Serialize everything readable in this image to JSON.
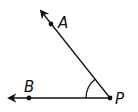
{
  "diagram": {
    "type": "angle",
    "colors": {
      "stroke": "#111111",
      "background": "#ffffff"
    },
    "vertex": {
      "label": "P",
      "x": 110,
      "y": 98
    },
    "rays": [
      {
        "name": "PA",
        "point_label": "A",
        "point": {
          "x": 51,
          "y": 24
        },
        "arrow_tip": {
          "x": 40,
          "y": 10
        }
      },
      {
        "name": "PB",
        "point_label": "B",
        "point": {
          "x": 29,
          "y": 98
        },
        "arrow_tip": {
          "x": 8,
          "y": 98
        }
      }
    ],
    "labels": {
      "A": "A",
      "B": "B",
      "P": "P"
    },
    "angle_mark": {
      "type": "arc",
      "radius": 24
    }
  }
}
